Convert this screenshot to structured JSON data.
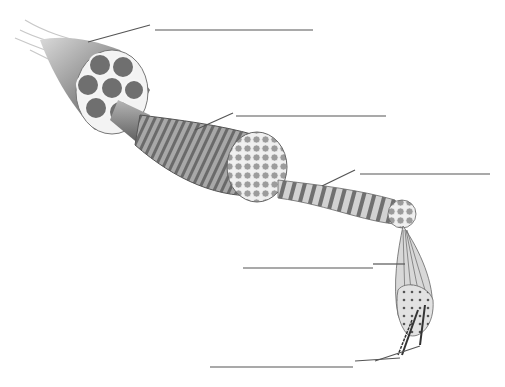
{
  "diagram": {
    "colors": {
      "background": "#ffffff",
      "line": "#555555",
      "tissue_dark": "#6b6b6b",
      "tissue_mid": "#9a9a9a",
      "tissue_light": "#cfcfcf"
    },
    "structures": [
      {
        "id": "muscle",
        "label": ""
      },
      {
        "id": "fascicle",
        "label": ""
      },
      {
        "id": "muscle-fiber",
        "label": ""
      },
      {
        "id": "myofibril",
        "label": ""
      },
      {
        "id": "filaments",
        "label": ""
      }
    ],
    "label_lines": [
      {
        "leader": [
          [
            88,
            42
          ],
          [
            150,
            25
          ]
        ],
        "blank": [
          [
            155,
            30
          ],
          [
            313,
            30
          ]
        ]
      },
      {
        "leader": [
          [
            195,
            130
          ],
          [
            233,
            113
          ]
        ],
        "blank": [
          [
            236,
            116
          ],
          [
            386,
            116
          ]
        ]
      },
      {
        "leader": [
          [
            322,
            186
          ],
          [
            355,
            170
          ]
        ],
        "blank": [
          [
            360,
            174
          ],
          [
            490,
            174
          ]
        ]
      },
      {
        "leader": [
          [
            373,
            264
          ],
          [
            405,
            264
          ]
        ],
        "blank": [
          [
            243,
            268
          ],
          [
            373,
            268
          ]
        ]
      },
      {
        "leader": [
          [
            355,
            360
          ],
          [
            420,
            340
          ]
        ],
        "blank": [
          [
            210,
            367
          ],
          [
            353,
            367
          ]
        ]
      }
    ]
  }
}
